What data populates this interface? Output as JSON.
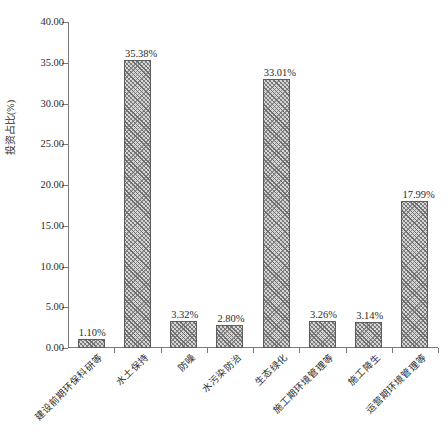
{
  "chart_data": {
    "type": "bar",
    "title": "",
    "xlabel": "",
    "ylabel": "投资占比(%)",
    "ylim": [
      0,
      40
    ],
    "ytick_step": 5,
    "grid": false,
    "legend": null,
    "categories": [
      "建设前期环保科研等",
      "水土保持",
      "防噪",
      "水污染防治",
      "生态绿化",
      "施工期环境管理等",
      "施工降生",
      "运营期环境管理等"
    ],
    "values": [
      1.1,
      35.38,
      3.32,
      2.8,
      33.01,
      3.26,
      3.14,
      17.99
    ],
    "data_labels": [
      "1.10%",
      "35.38%",
      "3.32%",
      "2.80%",
      "33.01%",
      "3.26%",
      "3.14%",
      "17.99%"
    ],
    "ytick_labels": [
      "0.00",
      "5.00",
      "10.00",
      "15.00",
      "20.00",
      "25.00",
      "30.00",
      "35.00",
      "40.00"
    ],
    "ytick_values": [
      0,
      5,
      10,
      15,
      20,
      25,
      30,
      35,
      40
    ],
    "colors": {
      "bar_fill": "#d6d6d6",
      "bar_hatch": "#6e6e6e",
      "bar_edge": "#5d5d5d",
      "axis": "#7a7a7a",
      "text": "#2b2b2b",
      "background": "#ffffff"
    }
  },
  "caption": ""
}
